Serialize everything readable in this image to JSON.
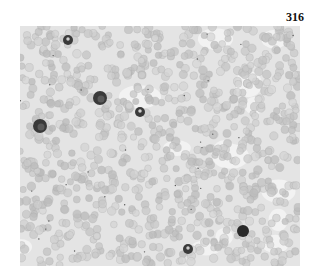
{
  "figure": {
    "number": "316"
  },
  "cells": [
    {
      "type": "segmented-leukocyte",
      "x": 68,
      "y": 40,
      "r": 5
    },
    {
      "type": "lymphocyte",
      "x": 100,
      "y": 98,
      "r": 7
    },
    {
      "type": "segmented-leukocyte",
      "x": 140,
      "y": 112,
      "r": 5
    },
    {
      "type": "lymphocyte",
      "x": 40,
      "y": 126,
      "r": 7
    },
    {
      "type": "small-lymphocyte",
      "x": 243,
      "y": 231,
      "r": 6
    },
    {
      "type": "segmented-leukocyte",
      "x": 188,
      "y": 249,
      "r": 5
    }
  ]
}
